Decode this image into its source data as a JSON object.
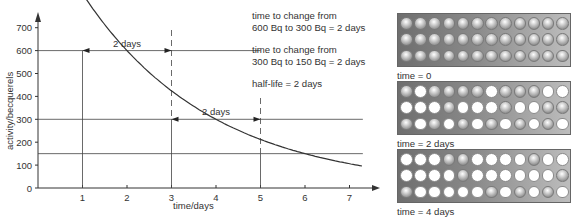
{
  "chart_data": {
    "type": "line",
    "title": "",
    "xlabel": "time/days",
    "ylabel": "activity/becquerels",
    "x_ticks": [
      "1",
      "2",
      "3",
      "4",
      "5",
      "6",
      "7"
    ],
    "y_ticks": [
      "0",
      "100",
      "200",
      "300",
      "400",
      "500",
      "600",
      "700"
    ],
    "xlim": [
      0,
      7.4
    ],
    "ylim": [
      0,
      720
    ],
    "grid": false,
    "series": [
      {
        "name": "activity",
        "x": [
          0,
          0.5,
          1,
          1.5,
          2,
          2.5,
          3,
          3.5,
          4,
          4.5,
          5,
          5.5,
          6,
          6.5,
          7,
          7.3
        ],
        "values": [
          1200,
          1009,
          600,
          505,
          424,
          357,
          300,
          252,
          212,
          178,
          150,
          126,
          106,
          89,
          75,
          69
        ]
      }
    ],
    "annotations": [
      {
        "type": "hline",
        "y": 600,
        "x_to": 1
      },
      {
        "type": "hline",
        "y": 300,
        "x_to": 7.3
      },
      {
        "type": "hline",
        "y": 150,
        "x_to": 7.3
      },
      {
        "type": "vline",
        "x": 1,
        "y_to": 600
      },
      {
        "type": "vline-dashed",
        "x": 3,
        "y_from": 300,
        "y_to": 720
      },
      {
        "type": "vline",
        "x": 3,
        "y_to": 300
      },
      {
        "type": "vline-dashed",
        "x": 5,
        "y_from": 150,
        "y_to": 380
      },
      {
        "type": "vline",
        "x": 5,
        "y_to": 150
      },
      {
        "type": "arrow",
        "x_from": 1,
        "x_to": 3,
        "y": 600,
        "label": "2 days"
      },
      {
        "type": "arrow",
        "x_from": 3,
        "x_to": 5,
        "y": 300,
        "label": "2 days"
      }
    ]
  },
  "axis": {
    "ylabel": "activity/becquerels",
    "xlabel": "time/days",
    "y_ticks": [
      "0",
      "100",
      "200",
      "300",
      "400",
      "500",
      "600",
      "700"
    ],
    "x_ticks": [
      "1",
      "2",
      "3",
      "4",
      "5",
      "6",
      "7"
    ],
    "arrow1_label": "2 days",
    "arrow2_label": "2 days"
  },
  "notes": {
    "n1_line1": "time to change from",
    "n1_line2": "600 Bq to 300 Bq = 2 days",
    "n2_line1": "time to change from",
    "n2_line2": "300 Bq to 150 Bq = 2 days",
    "n3": "half-life = 2 days"
  },
  "grids": [
    {
      "label": "time = 0",
      "rows": [
        "SSSSSSSSSSSS",
        "SSSSSSSSSSSS",
        "SSSSSSSSSSSS"
      ]
    },
    {
      "label": "time = 2 days",
      "rows": [
        "SWSSSSWSSSWW",
        "WWWSWWWSWWSS",
        "SWSWSWSWSWSW"
      ]
    },
    {
      "label": "time = 4 days",
      "rows": [
        "WWWSSWWWWSWW",
        "WWWWSWWWWWWS",
        "SWWWWWSWSWSW"
      ]
    }
  ],
  "legend": {
    "s": "undecayed nucleus (shaded ball)",
    "w": "decayed nucleus (white)"
  }
}
